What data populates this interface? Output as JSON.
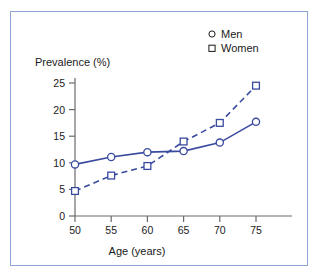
{
  "figure": {
    "frame_color": "#8fa3d4",
    "background": "#ffffff"
  },
  "legend": {
    "position": "top-right",
    "entries": [
      {
        "label": "Men",
        "marker": "circle-marker-icon"
      },
      {
        "label": "Women",
        "marker": "square-marker-icon"
      }
    ]
  },
  "axes": {
    "y_title": "Prevalence (%)",
    "x_title": "Age (years)",
    "y_ticks": [
      "0",
      "5",
      "10",
      "15",
      "20",
      "25"
    ],
    "x_ticks": [
      "50",
      "55",
      "60",
      "65",
      "70",
      "75"
    ]
  },
  "chart_data": {
    "type": "line",
    "title": "",
    "xlabel": "Age (years)",
    "ylabel": "Prevalence (%)",
    "xlim": [
      50,
      78
    ],
    "ylim": [
      0,
      27
    ],
    "xticks": [
      50,
      55,
      60,
      65,
      70,
      75
    ],
    "yticks": [
      0,
      5,
      10,
      15,
      20,
      25
    ],
    "grid": false,
    "legend_position": "top-right",
    "x": [
      50,
      55,
      60,
      65,
      70,
      75
    ],
    "series": [
      {
        "name": "Men",
        "marker": "circle",
        "linestyle": "solid",
        "color": "#3a4a9f",
        "values": [
          9.7,
          11.1,
          12.0,
          12.2,
          13.8,
          17.7
        ]
      },
      {
        "name": "Women",
        "marker": "square",
        "linestyle": "dashed",
        "color": "#3a4a9f",
        "values": [
          4.7,
          7.6,
          9.4,
          14.0,
          17.5,
          24.5
        ]
      }
    ]
  }
}
